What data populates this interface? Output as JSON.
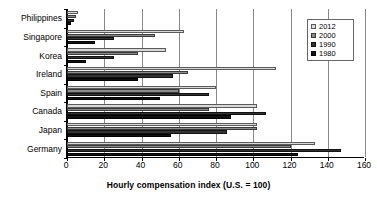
{
  "chart_data": {
    "type": "bar",
    "orientation": "horizontal",
    "title": "",
    "xlabel": "Hourly compensation index (U.S. = 100)",
    "ylabel": "",
    "xlim": [
      0,
      160
    ],
    "xticks": [
      0,
      20,
      40,
      60,
      80,
      100,
      120,
      140,
      160
    ],
    "grid": true,
    "legend_position": "top-right",
    "categories": [
      "Philippines",
      "Singapore",
      "Korea",
      "Ireland",
      "Spain",
      "Canada",
      "Japan",
      "Germany"
    ],
    "series": [
      {
        "name": "2012",
        "color": "#d9d9d9",
        "values": [
          6,
          63,
          53,
          112,
          80,
          102,
          102,
          133
        ]
      },
      {
        "name": "2000",
        "color": "#8c8c8c",
        "values": [
          5,
          47,
          38,
          65,
          60,
          76,
          102,
          120
        ]
      },
      {
        "name": "1990",
        "color": "#333333",
        "values": [
          4,
          25,
          25,
          57,
          76,
          107,
          86,
          147
        ]
      },
      {
        "name": "1980",
        "color": "#111111",
        "values": [
          2,
          15,
          10,
          38,
          50,
          88,
          56,
          124
        ]
      }
    ]
  },
  "legend": {
    "entries": [
      {
        "label": "2012"
      },
      {
        "label": "2000"
      },
      {
        "label": "1990"
      },
      {
        "label": "1980"
      }
    ]
  },
  "axis": {
    "x_title": "Hourly compensation index (U.S. = 100)",
    "tick_labels": [
      "0",
      "20",
      "40",
      "60",
      "80",
      "100",
      "120",
      "140",
      "160"
    ]
  }
}
